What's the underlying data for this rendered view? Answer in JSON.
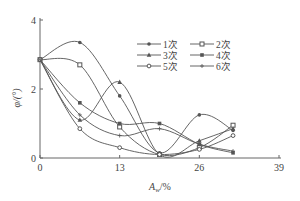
{
  "chart_data": {
    "type": "line",
    "title": "",
    "xlabel": "A_w/%",
    "ylabel": "φ/(°)",
    "x": [
      0,
      6.5,
      13,
      19.5,
      26,
      31.5
    ],
    "xlim": [
      0,
      39
    ],
    "ylim": [
      0,
      4
    ],
    "xticks": [
      0,
      13,
      26,
      39
    ],
    "yticks": [
      0,
      2,
      4
    ],
    "grid": false,
    "legend_position": "upper right",
    "series": [
      {
        "name": "1次",
        "marker": "dot",
        "values": [
          2.85,
          3.35,
          1.8,
          0.15,
          1.25,
          0.8
        ]
      },
      {
        "name": "2次",
        "marker": "square",
        "values": [
          2.85,
          2.7,
          0.9,
          0.1,
          0.3,
          0.95
        ]
      },
      {
        "name": "3次",
        "marker": "triangle",
        "values": [
          2.85,
          1.1,
          2.2,
          0.1,
          0.5,
          0.85
        ]
      },
      {
        "name": "4次",
        "marker": "diamond",
        "values": [
          2.85,
          1.6,
          1.0,
          1.0,
          0.4,
          0.15
        ]
      },
      {
        "name": "5次",
        "marker": "circle",
        "values": [
          2.85,
          0.85,
          0.3,
          0.1,
          0.25,
          0.65
        ]
      },
      {
        "name": "6次",
        "marker": "plus",
        "values": [
          2.85,
          1.25,
          0.65,
          0.85,
          0.4,
          0.2
        ]
      }
    ]
  },
  "axes": {
    "x_label_main": "A",
    "x_label_sub": "w",
    "x_label_unit": "/%",
    "y_label": "φ/(°)",
    "x_ticks": [
      "0",
      "13",
      "26",
      "39"
    ],
    "y_ticks": [
      "0",
      "2",
      "4"
    ]
  },
  "legend": [
    "1次",
    "2次",
    "3次",
    "4次",
    "5次",
    "6次"
  ],
  "colors": {
    "line": "#555555",
    "axis": "#666666"
  }
}
